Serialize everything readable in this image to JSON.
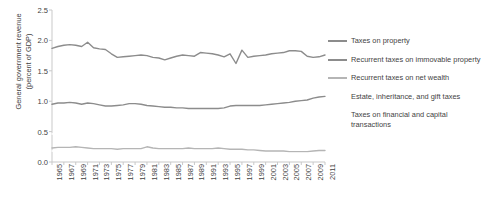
{
  "chart_data": {
    "type": "line",
    "title": "",
    "xlabel": "",
    "ylabel": "General government revenue\n(percent of GDP)",
    "ylim": [
      0.0,
      2.5
    ],
    "yticks": [
      "0.0",
      "0.5",
      "1.0",
      "1.5",
      "2.0",
      "2.5"
    ],
    "ytick_values": [
      0.0,
      0.5,
      1.0,
      1.5,
      2.0,
      2.5
    ],
    "grid": false,
    "legend_position": "right",
    "x": [
      1965,
      1966,
      1967,
      1968,
      1969,
      1970,
      1971,
      1972,
      1973,
      1974,
      1975,
      1976,
      1977,
      1978,
      1979,
      1980,
      1981,
      1982,
      1983,
      1984,
      1985,
      1986,
      1987,
      1988,
      1989,
      1990,
      1991,
      1992,
      1993,
      1994,
      1995,
      1996,
      1997,
      1998,
      1999,
      2000,
      2001,
      2002,
      2003,
      2004,
      2005,
      2006,
      2007,
      2008,
      2009,
      2010,
      2011
    ],
    "xticks": [
      "1965",
      "1967",
      "1969",
      "1971",
      "1973",
      "1975",
      "1977",
      "1979",
      "1981",
      "1983",
      "1985",
      "1987",
      "1989",
      "1991",
      "1993",
      "1995",
      "1997",
      "1999",
      "2001",
      "2003",
      "2005",
      "2007",
      "2009",
      "2011"
    ],
    "series": [
      {
        "name": "Taxes on property",
        "color": "#8c8c8c",
        "values": [
          1.87,
          1.9,
          1.92,
          1.93,
          1.92,
          1.9,
          1.97,
          1.88,
          1.86,
          1.85,
          1.78,
          1.72,
          1.73,
          1.74,
          1.75,
          1.76,
          1.75,
          1.72,
          1.71,
          1.68,
          1.71,
          1.74,
          1.76,
          1.75,
          1.74,
          1.8,
          1.79,
          1.78,
          1.76,
          1.73,
          1.78,
          1.62,
          1.84,
          1.72,
          1.74,
          1.75,
          1.76,
          1.78,
          1.79,
          1.8,
          1.83,
          1.83,
          1.82,
          1.74,
          1.72,
          1.73,
          1.76
        ]
      },
      {
        "name": "Recurrent taxes on immovable property",
        "color": "#8c8c8c",
        "values": [
          0.95,
          0.97,
          0.97,
          0.98,
          0.97,
          0.95,
          0.97,
          0.96,
          0.94,
          0.92,
          0.92,
          0.93,
          0.94,
          0.96,
          0.96,
          0.95,
          0.93,
          0.92,
          0.91,
          0.9,
          0.9,
          0.89,
          0.89,
          0.88,
          0.88,
          0.88,
          0.88,
          0.88,
          0.88,
          0.89,
          0.92,
          0.93,
          0.93,
          0.93,
          0.93,
          0.93,
          0.94,
          0.95,
          0.96,
          0.97,
          0.98,
          1.0,
          1.01,
          1.02,
          1.05,
          1.07,
          1.08
        ]
      },
      {
        "name": "Recurrent taxes on net wealth",
        "color": "#b5b5b5",
        "values": [
          0.23,
          0.24,
          0.24,
          0.24,
          0.25,
          0.24,
          0.23,
          0.22,
          0.22,
          0.22,
          0.22,
          0.21,
          0.22,
          0.22,
          0.22,
          0.22,
          0.25,
          0.23,
          0.22,
          0.22,
          0.22,
          0.22,
          0.22,
          0.23,
          0.22,
          0.22,
          0.22,
          0.22,
          0.23,
          0.22,
          0.21,
          0.21,
          0.21,
          0.2,
          0.2,
          0.19,
          0.18,
          0.18,
          0.18,
          0.18,
          0.17,
          0.17,
          0.17,
          0.17,
          0.18,
          0.19,
          0.19
        ]
      },
      {
        "name": "Estate, inheritance, and gift taxes",
        "color": "#ffffff",
        "values": [
          0.18,
          0.18,
          0.18,
          0.18,
          0.18,
          0.18,
          0.18,
          0.17,
          0.17,
          0.17,
          0.16,
          0.16,
          0.16,
          0.16,
          0.16,
          0.16,
          0.16,
          0.15,
          0.15,
          0.15,
          0.15,
          0.15,
          0.15,
          0.15,
          0.15,
          0.15,
          0.15,
          0.15,
          0.15,
          0.15,
          0.15,
          0.15,
          0.15,
          0.15,
          0.14,
          0.14,
          0.14,
          0.14,
          0.14,
          0.14,
          0.14,
          0.14,
          0.14,
          0.14,
          0.13,
          0.13,
          0.13
        ]
      },
      {
        "name": "Taxes on financial and capital transactions",
        "color": "#ffffff",
        "values": [
          0.46,
          0.47,
          0.48,
          0.49,
          0.48,
          0.48,
          0.52,
          0.48,
          0.48,
          0.47,
          0.43,
          0.4,
          0.4,
          0.4,
          0.42,
          0.42,
          0.42,
          0.41,
          0.42,
          0.41,
          0.43,
          0.47,
          0.49,
          0.48,
          0.48,
          0.53,
          0.53,
          0.52,
          0.5,
          0.47,
          0.5,
          0.33,
          0.55,
          0.44,
          0.46,
          0.48,
          0.49,
          0.51,
          0.51,
          0.51,
          0.54,
          0.52,
          0.5,
          0.41,
          0.36,
          0.34,
          0.36
        ]
      }
    ],
    "legend": [
      {
        "label": "Taxes on property",
        "swatch": "#8c8c8c",
        "swatch_visible": true
      },
      {
        "label": "Recurrent taxes on immovable property",
        "swatch": "#8c8c8c",
        "swatch_visible": true
      },
      {
        "label": "Recurrent taxes on net wealth",
        "swatch": "#b5b5b5",
        "swatch_visible": true
      },
      {
        "label": "Estate, inheritance, and gift taxes",
        "swatch": "#ffffff",
        "swatch_visible": false
      },
      {
        "label": "Taxes on financial and capital transactions",
        "swatch": "#ffffff",
        "swatch_visible": false
      }
    ],
    "axis_color": "#c9c9c9",
    "text_color": "#3f3f3f"
  }
}
